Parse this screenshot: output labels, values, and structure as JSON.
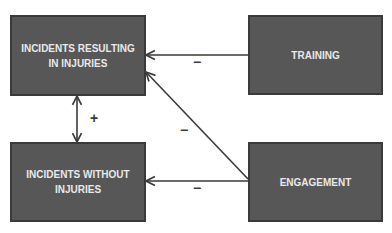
{
  "diagram": {
    "nodes": [
      {
        "id": "incidents_injuries",
        "label": "INCIDENTS RESULTING IN INJURIES"
      },
      {
        "id": "training",
        "label": "TRAINING"
      },
      {
        "id": "incidents_no_injuries",
        "label": "INCIDENTS WITHOUT INJURIES"
      },
      {
        "id": "engagement",
        "label": "ENGAGEMENT"
      }
    ],
    "edges": [
      {
        "from": "training",
        "to": "incidents_injuries",
        "sign": "−"
      },
      {
        "from": "engagement",
        "to": "incidents_injuries",
        "sign": "−"
      },
      {
        "from": "engagement",
        "to": "incidents_no_injuries",
        "sign": "−"
      },
      {
        "from": "incidents_injuries",
        "to": "incidents_no_injuries",
        "sign": "+",
        "bidirectional": true
      }
    ]
  },
  "colors": {
    "box_fill": "#575757",
    "box_border": "#3a3a3a",
    "box_text": "#e9e9e9",
    "line": "#3a3a3a"
  }
}
